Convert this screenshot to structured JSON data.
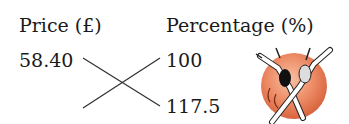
{
  "headers": {
    "price": "Price (£)",
    "percentage": "Percentage (%)"
  },
  "values": {
    "price_known": "58.40",
    "percentage_top": "100",
    "percentage_bottom": "117.5"
  },
  "icon": {
    "name": "dancers-illustration",
    "circle_color": "#e8825e"
  }
}
